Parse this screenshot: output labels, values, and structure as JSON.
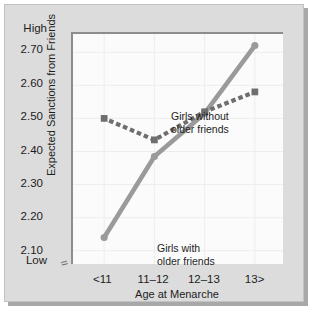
{
  "chart_data": {
    "type": "line",
    "title": "",
    "xlabel": "Age at Menarche",
    "ylabel": "Expected Sanctions from Friends",
    "categories": [
      "<11",
      "11–12",
      "12–13",
      "13>"
    ],
    "yticks": [
      "2.10",
      "2.20",
      "2.30",
      "2.40",
      "2.50",
      "2.60",
      "2.70"
    ],
    "ylim": [
      2.06,
      2.755
    ],
    "y_axis_high_label": "High",
    "y_axis_low_label": "Low",
    "axis_break_symbol": "≈",
    "grid": true,
    "legend_position": "inline-annotations",
    "series": [
      {
        "name": "Girls with older friends",
        "label_text": "Girls with\nolder friends",
        "style": "solid",
        "marker": "circle",
        "color": "#9a9a9a",
        "values": [
          2.14,
          2.385,
          2.515,
          2.72
        ]
      },
      {
        "name": "Girls without older friends",
        "label_text": "Girls without\nolder friends",
        "style": "dotted",
        "marker": "square",
        "color": "#6e6e6e",
        "values": [
          2.5,
          2.435,
          2.52,
          2.58
        ]
      }
    ]
  },
  "colors": {
    "panel_background": "#dcdcdc",
    "plot_background": "#fbfbfb",
    "axis": "#8d8d8d",
    "grid": "#ededed",
    "solid_series": "#9a9a9a",
    "dotted_series": "#6e6e6e",
    "text": "#1d1d1d"
  }
}
